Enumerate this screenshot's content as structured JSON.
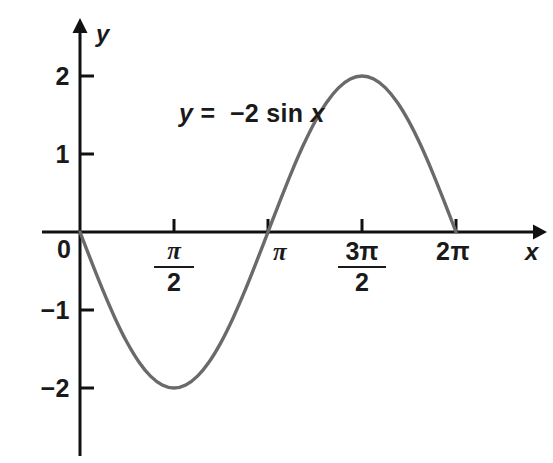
{
  "chart_data": {
    "type": "line",
    "title": "",
    "subtitle": "",
    "xlabel": "x",
    "ylabel": "y",
    "annotations": [
      {
        "text": "y = -2 sin x",
        "parts": {
          "lhs": "y",
          "equals": "=",
          "rhs_sign": "−",
          "rhs_coeff": "2",
          "rhs_func": "sin",
          "rhs_var": "x"
        },
        "x": 1.0,
        "y": 1.55
      }
    ],
    "equation": "y = -2 sin(x)",
    "grid": false,
    "legend": false,
    "xlim": [
      0,
      7.33
    ],
    "ylim": [
      -2.87,
      2.72
    ],
    "x_ticks": [
      {
        "value": 1.5707963,
        "label": "π/2",
        "numerator": "π",
        "denominator": "2",
        "is_fraction": true
      },
      {
        "value": 3.1415927,
        "label": "π",
        "is_fraction": false
      },
      {
        "value": 4.712389,
        "label": "3π/2",
        "numerator": "3π",
        "denominator": "2",
        "is_fraction": true
      },
      {
        "value": 6.2831853,
        "label": "2π",
        "is_fraction": false
      }
    ],
    "y_ticks": [
      {
        "value": 2,
        "label": "2"
      },
      {
        "value": 1,
        "label": "1"
      },
      {
        "value": -1,
        "label": "−1"
      },
      {
        "value": -2,
        "label": "−2"
      }
    ],
    "origin_label": "0",
    "series": [
      {
        "name": "y = -2 sin x",
        "color": "#6a6a6a",
        "linewidth": 3,
        "x": [
          0,
          0.19635,
          0.3927,
          0.58905,
          0.7854,
          0.98175,
          1.1781,
          1.37445,
          1.5708,
          1.76715,
          1.9635,
          2.15984,
          2.35619,
          2.55254,
          2.74889,
          2.94524,
          3.14159,
          3.33794,
          3.53429,
          3.73064,
          3.92699,
          4.12334,
          4.31969,
          4.51604,
          4.71239,
          4.90874,
          5.10509,
          5.30144,
          5.49779,
          5.69414,
          5.89049,
          6.08684,
          6.28319
        ],
        "y": [
          0,
          -0.39018,
          -0.76537,
          -1.11114,
          -1.41421,
          -1.66294,
          -1.84776,
          -1.96157,
          -2.0,
          -1.96157,
          -1.84776,
          -1.66294,
          -1.41421,
          -1.11114,
          -0.76537,
          -0.39018,
          0,
          0.39018,
          0.76537,
          1.11114,
          1.41421,
          1.66294,
          1.84776,
          1.96157,
          2.0,
          1.96157,
          1.84776,
          1.66294,
          1.41421,
          1.11114,
          0.76537,
          0.39018,
          0
        ]
      }
    ],
    "maximum": {
      "x": 4.712389,
      "y": 2.0,
      "label": "3π/2"
    },
    "minimum": {
      "x": 1.570796,
      "y": -2.0,
      "label": "π/2"
    },
    "zero_crossings": [
      0,
      3.1415927,
      6.2831853
    ],
    "amplitude": 2,
    "period": 6.2831853,
    "colors": {
      "curve": "#6a6a6a",
      "axis": "#111111",
      "text": "#1a1a1a",
      "background": "#ffffff"
    }
  }
}
